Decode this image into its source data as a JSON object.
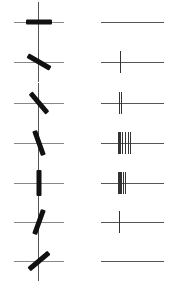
{
  "figure": {
    "rows": [
      {
        "bar_angle_deg": 0,
        "spike_count": 0,
        "spike_offsets": []
      },
      {
        "bar_angle_deg": 30,
        "spike_count": 1,
        "spike_offsets": [
          19
        ]
      },
      {
        "bar_angle_deg": 50,
        "spike_count": 2,
        "spike_offsets": [
          18,
          20
        ]
      },
      {
        "bar_angle_deg": 70,
        "spike_count": 7,
        "spike_offsets": [
          17,
          18,
          19,
          21,
          24,
          27,
          29
        ]
      },
      {
        "bar_angle_deg": 90,
        "spike_count": 6,
        "spike_offsets": [
          17,
          18,
          19,
          20,
          22,
          24
        ]
      },
      {
        "bar_angle_deg": 110,
        "spike_count": 1,
        "spike_offsets": [
          18
        ]
      },
      {
        "bar_angle_deg": 140,
        "spike_count": 0,
        "spike_offsets": []
      }
    ],
    "colors": {
      "bar": "#111111",
      "axes": "#555555",
      "spike": "#333333",
      "background": "#ffffff"
    }
  }
}
